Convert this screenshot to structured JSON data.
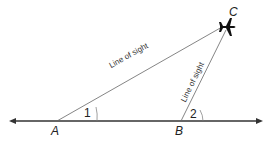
{
  "diagram": {
    "points": {
      "A": "A",
      "B": "B",
      "C": "C"
    },
    "angles": {
      "angle1": "1",
      "angle2": "2"
    },
    "lines": {
      "AC_label": "Line of sight",
      "BC_label": "Line of sight"
    },
    "icons": {
      "object_at_C": "airplane-icon"
    }
  }
}
